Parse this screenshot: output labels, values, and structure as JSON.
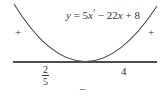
{
  "figure": {
    "equation": "y = 5x² − 22x + 8",
    "equation_parts": {
      "y": "y",
      "eq": " = ",
      "coef1": "5",
      "x1": "x",
      "sq": "²",
      "minus": " − ",
      "coef2": "22",
      "x2": "x",
      "plus": " + ",
      "const": "8"
    },
    "roots": {
      "left": {
        "numerator": "2",
        "denominator": "5"
      },
      "right": "4"
    },
    "signs": {
      "left": "+",
      "right": "+",
      "middle": "–"
    },
    "colors": {
      "curve": "#555555",
      "axis": "#111111",
      "text": "#333333"
    }
  }
}
